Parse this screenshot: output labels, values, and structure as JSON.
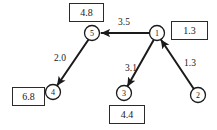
{
  "diagram": {
    "type": "directed-weighted-graph",
    "nodes": [
      {
        "id": "1",
        "label": "1",
        "cx": 157,
        "cy": 33,
        "r": 7.5
      },
      {
        "id": "2",
        "label": "2",
        "cx": 198,
        "cy": 95,
        "r": 7.5
      },
      {
        "id": "3",
        "label": "3",
        "cx": 124,
        "cy": 93,
        "r": 7.5
      },
      {
        "id": "4",
        "label": "4",
        "cx": 53,
        "cy": 92,
        "r": 7.5
      },
      {
        "id": "5",
        "label": "5",
        "cx": 92,
        "cy": 33,
        "r": 7.5
      }
    ],
    "edges": [
      {
        "id": "e-1-5",
        "from": "1",
        "to": "5",
        "weight": "3.5",
        "wx": 124,
        "wy": 22
      },
      {
        "id": "e-5-4",
        "from": "5",
        "to": "4",
        "weight": "2.0",
        "wx": 60,
        "wy": 58
      },
      {
        "id": "e-1-3",
        "from": "1",
        "to": "3",
        "weight": "3.1",
        "wx": 131,
        "wy": 68
      },
      {
        "id": "e-2-1",
        "from": "2",
        "to": "1",
        "weight": "1.3",
        "wx": 190,
        "wy": 63
      }
    ],
    "value_boxes": [
      {
        "id": "box-node-5",
        "node": "5",
        "value": "4.8",
        "x": 69,
        "y": 3,
        "w": 35,
        "h": 19
      },
      {
        "id": "box-node-1",
        "node": "1",
        "value": "1.3",
        "x": 171,
        "y": 21,
        "w": 37,
        "h": 19
      },
      {
        "id": "box-node-4",
        "node": "4",
        "value": "6.8",
        "x": 12,
        "y": 87,
        "w": 33,
        "h": 19
      },
      {
        "id": "box-node-3",
        "node": "3",
        "value": "4.4",
        "x": 109,
        "y": 105,
        "w": 36,
        "h": 19
      }
    ],
    "colors": {
      "stroke": "#1a1a1a",
      "box_border": "#2b2b2b",
      "background": "#ffffff"
    }
  }
}
